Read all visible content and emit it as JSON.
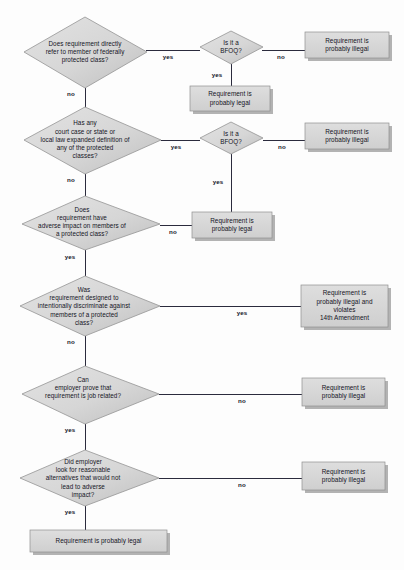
{
  "diagram": {
    "type": "flowchart",
    "colors": {
      "background": "#fdfdfd",
      "shape_fill_light": "#dcdcdc",
      "shape_fill_dark": "#c3c3c3",
      "shape_stroke": "#8f8f8f",
      "box_fill": "#d8d8d8",
      "box_shadow": "#a9a9a9",
      "connector": "#2b2b3d",
      "text": "#14141e"
    }
  },
  "nodes": [
    {
      "id": "d1",
      "shape": "decision",
      "text": "Does requirement directly\nrefer to member of federally\nprotected class?"
    },
    {
      "id": "d2",
      "shape": "decision",
      "text": "Is it a\nBFOQ?"
    },
    {
      "id": "t1",
      "shape": "terminator",
      "text": "Requirement is\nprobably illegal"
    },
    {
      "id": "t2",
      "shape": "terminator",
      "text": "Requirement is\nprobably legal"
    },
    {
      "id": "d3",
      "shape": "decision",
      "text": "Has any\ncourt case or state or\nlocal law expanded definition of\nany of the protected\nclasses?"
    },
    {
      "id": "d4",
      "shape": "decision",
      "text": "Is it a\nBFOQ?"
    },
    {
      "id": "t3",
      "shape": "terminator",
      "text": "Requirement is\nprobably illegal"
    },
    {
      "id": "t4",
      "shape": "terminator",
      "text": "Requirement is\nprobably legal"
    },
    {
      "id": "d5",
      "shape": "decision",
      "text": "Does\nrequirement have\nadverse impact on members of\na protected class?"
    },
    {
      "id": "d6",
      "shape": "decision",
      "text": "Was\nrequirement designed to\nintentionally discriminate against\nmembers of a protected\nclass?"
    },
    {
      "id": "t5",
      "shape": "terminator",
      "text": "Requirement is\nprobably illegal and\nviolates\n14th Amendment"
    },
    {
      "id": "d7",
      "shape": "decision",
      "text": "Can\nemployer prove that\nrequirement is job related?"
    },
    {
      "id": "t6",
      "shape": "terminator",
      "text": "Requirement is\nprobably illegal"
    },
    {
      "id": "d8",
      "shape": "decision",
      "text": "Did employer\nlook for reasonable\nalternatives that would not\nlead to adverse\nimpact?"
    },
    {
      "id": "t7",
      "shape": "terminator",
      "text": "Requirement is\nprobably illegal"
    },
    {
      "id": "t8",
      "shape": "terminator",
      "text": "Requirement is probably legal"
    }
  ],
  "edges": [
    {
      "id": "e1",
      "from": "d1",
      "to": "d2",
      "label": "yes"
    },
    {
      "id": "e2",
      "from": "d1",
      "to": "d3",
      "label": "no"
    },
    {
      "id": "e3",
      "from": "d2",
      "to": "t1",
      "label": "no"
    },
    {
      "id": "e4",
      "from": "d2",
      "to": "t2",
      "label": "yes"
    },
    {
      "id": "e5",
      "from": "d3",
      "to": "d4",
      "label": "yes"
    },
    {
      "id": "e6",
      "from": "d3",
      "to": "d5",
      "label": "no"
    },
    {
      "id": "e7",
      "from": "d4",
      "to": "t3",
      "label": "no"
    },
    {
      "id": "e8",
      "from": "d4",
      "to": "t4",
      "label": "yes"
    },
    {
      "id": "e9",
      "from": "d5",
      "to": "t4",
      "label": "no"
    },
    {
      "id": "e10",
      "from": "d5",
      "to": "d6",
      "label": "yes"
    },
    {
      "id": "e11",
      "from": "d6",
      "to": "t5",
      "label": "yes"
    },
    {
      "id": "e12",
      "from": "d6",
      "to": "d7",
      "label": "no"
    },
    {
      "id": "e13",
      "from": "d7",
      "to": "t6",
      "label": "no"
    },
    {
      "id": "e14",
      "from": "d7",
      "to": "d8",
      "label": "yes"
    },
    {
      "id": "e15",
      "from": "d8",
      "to": "t7",
      "label": "no"
    },
    {
      "id": "e16",
      "from": "d8",
      "to": "t8",
      "label": "yes"
    }
  ]
}
